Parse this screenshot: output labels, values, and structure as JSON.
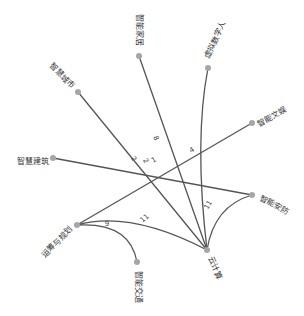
{
  "graph": {
    "type": "network",
    "nodes": [
      {
        "id": "home",
        "label": "智能家居"
      },
      {
        "id": "vhuman",
        "label": "虚拟数字人"
      },
      {
        "id": "city",
        "label": "智慧城市"
      },
      {
        "id": "ent",
        "label": "智能文娱"
      },
      {
        "id": "building",
        "label": "智慧建筑"
      },
      {
        "id": "security",
        "label": "智能安防"
      },
      {
        "id": "ops",
        "label": "运筹与规划"
      },
      {
        "id": "traffic",
        "label": "智能交通"
      },
      {
        "id": "cloud",
        "label": "云计算"
      }
    ],
    "edges": [
      {
        "source": "home",
        "target": "cloud",
        "label": "8"
      },
      {
        "source": "vhuman",
        "target": "cloud",
        "label": ""
      },
      {
        "source": "city",
        "target": "cloud",
        "label": "2"
      },
      {
        "source": "ent",
        "target": "ops",
        "label": "4"
      },
      {
        "source": "building",
        "target": "security",
        "label": "1"
      },
      {
        "source": "ops",
        "target": "cloud",
        "label": "11"
      },
      {
        "source": "security",
        "target": "cloud",
        "label": "11"
      },
      {
        "source": "ops",
        "target": "traffic",
        "label": "9"
      },
      {
        "source": "ops",
        "target": "home",
        "label": "2"
      }
    ],
    "colors": {
      "edge": "#555555",
      "node": "#a6a6a6",
      "text": "#333333"
    }
  }
}
